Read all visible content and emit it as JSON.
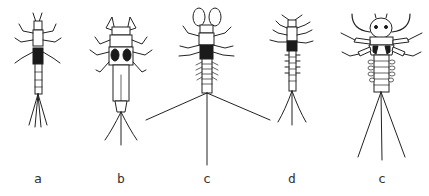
{
  "plate": {
    "background": "#ffffff",
    "ink": "#222222",
    "figures": [
      {
        "id": "a",
        "label": "a",
        "x": 38
      },
      {
        "id": "b",
        "label": "b",
        "x": 121
      },
      {
        "id": "c",
        "label": "c",
        "x": 207
      },
      {
        "id": "d",
        "label": "d",
        "x": 292
      },
      {
        "id": "e",
        "label": "c",
        "x": 382
      }
    ]
  }
}
